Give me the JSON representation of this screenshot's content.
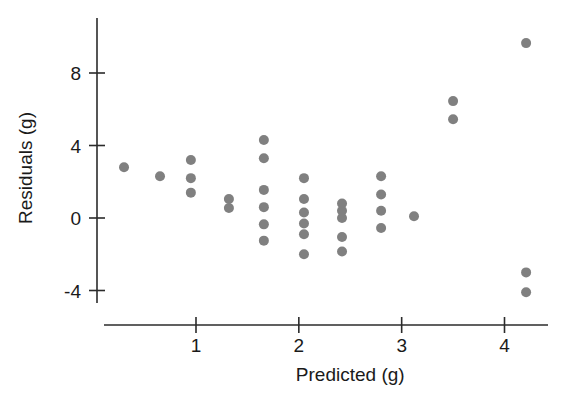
{
  "chart_data": {
    "type": "scatter",
    "title": "",
    "xlabel": "Predicted (g)",
    "ylabel": "Residuals (g)",
    "xlim": [
      0.0,
      4.55
    ],
    "ylim": [
      -5.2,
      10.6
    ],
    "xticks": [
      1,
      2,
      3,
      4
    ],
    "xtick_labels": [
      "1",
      "2",
      "3",
      "4"
    ],
    "yticks": [
      -4,
      0,
      4,
      8
    ],
    "ytick_labels": [
      "-4",
      "0",
      "4",
      "8"
    ],
    "grid": false,
    "legend": null,
    "marker": {
      "shape": "circle",
      "color": "#808080",
      "size": 9
    },
    "n_points": 33,
    "points": [
      {
        "x": 0.3,
        "y": 2.8
      },
      {
        "x": 0.65,
        "y": 2.3
      },
      {
        "x": 0.95,
        "y": 3.2
      },
      {
        "x": 0.95,
        "y": 2.2
      },
      {
        "x": 0.95,
        "y": 1.4
      },
      {
        "x": 1.32,
        "y": 1.05
      },
      {
        "x": 1.32,
        "y": 0.55
      },
      {
        "x": 1.66,
        "y": 4.3
      },
      {
        "x": 1.66,
        "y": 3.3
      },
      {
        "x": 1.66,
        "y": 1.55
      },
      {
        "x": 1.66,
        "y": 0.6
      },
      {
        "x": 1.66,
        "y": -0.35
      },
      {
        "x": 1.66,
        "y": -1.25
      },
      {
        "x": 2.05,
        "y": 2.2
      },
      {
        "x": 2.05,
        "y": 1.05
      },
      {
        "x": 2.05,
        "y": 0.3
      },
      {
        "x": 2.05,
        "y": -0.3
      },
      {
        "x": 2.05,
        "y": -0.9
      },
      {
        "x": 2.05,
        "y": -2.0
      },
      {
        "x": 2.42,
        "y": 0.8
      },
      {
        "x": 2.42,
        "y": 0.4
      },
      {
        "x": 2.42,
        "y": 0.0
      },
      {
        "x": 2.42,
        "y": -1.05
      },
      {
        "x": 2.42,
        "y": -1.85
      },
      {
        "x": 2.8,
        "y": 2.3
      },
      {
        "x": 2.8,
        "y": 1.3
      },
      {
        "x": 2.8,
        "y": 0.4
      },
      {
        "x": 2.8,
        "y": -0.55
      },
      {
        "x": 3.12,
        "y": 0.1
      },
      {
        "x": 3.5,
        "y": 6.45
      },
      {
        "x": 3.5,
        "y": 5.45
      },
      {
        "x": 4.21,
        "y": 9.65
      },
      {
        "x": 4.21,
        "y": -3.0
      },
      {
        "x": 4.21,
        "y": -4.1
      }
    ]
  },
  "figure": {
    "background_color": "#ffffff",
    "axis_color": "#2b2b2b",
    "point_color": "#808080"
  }
}
